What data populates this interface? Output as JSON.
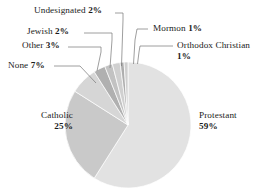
{
  "chart_data": {
    "type": "pie",
    "title": "",
    "subtitle": "",
    "xlabel": "",
    "ylabel": "",
    "legend_position": "none",
    "grid": false,
    "units": "percent",
    "start_angle_deg": 0,
    "direction": "clockwise",
    "categories": [
      "Protestant",
      "Catholic",
      "None",
      "Other",
      "Jewish",
      "Undesignated",
      "Mormon",
      "Orthodox Christian"
    ],
    "values": [
      59,
      25,
      7,
      3,
      2,
      2,
      1,
      1
    ],
    "slices": [
      {
        "label": "Protestant",
        "value": 59,
        "display": "59%",
        "color": "#e2e2e2"
      },
      {
        "label": "Catholic",
        "value": 25,
        "display": "25%",
        "color": "#c9c9c9"
      },
      {
        "label": "None",
        "value": 7,
        "display": "7%",
        "color": "#d6d6d6"
      },
      {
        "label": "Other",
        "value": 3,
        "display": "3%",
        "color": "#b0b0b0"
      },
      {
        "label": "Jewish",
        "value": 2,
        "display": "2%",
        "color": "#c2c2c2"
      },
      {
        "label": "Undesignated",
        "value": 2,
        "display": "2%",
        "color": "#d0d0d0"
      },
      {
        "label": "Mormon",
        "value": 1,
        "display": "1%",
        "color": "#aeaeae"
      },
      {
        "label": "Orthodox Christian",
        "value": 1,
        "display": "1%",
        "color": "#cfcfcf"
      }
    ]
  },
  "labels": {
    "undesignated": {
      "name": "Undesignated",
      "pct": "2%"
    },
    "jewish": {
      "name": "Jewish",
      "pct": "2%"
    },
    "other": {
      "name": "Other",
      "pct": "3%"
    },
    "none": {
      "name": "None",
      "pct": "7%"
    },
    "catholic": {
      "name": "Catholic",
      "pct": "25%"
    },
    "protestant": {
      "name": "Protestant",
      "pct": "59%"
    },
    "mormon": {
      "name": "Mormon",
      "pct": "1%"
    },
    "orthodox": {
      "name": "Orthodox Christian",
      "pct": "1%"
    }
  },
  "style": {
    "background": "#ffffff",
    "text_color": "#1b1b1b",
    "leader_line_color": "#7a7a7a",
    "slice_outline": "#ffffff"
  }
}
